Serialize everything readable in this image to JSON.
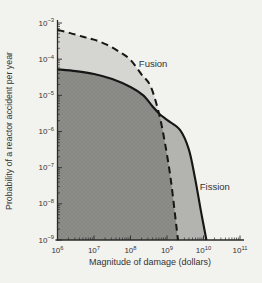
{
  "figure": {
    "background": "#f2f2ef",
    "text_color": "#333333",
    "curve_color": "#161616"
  },
  "chart_data": {
    "type": "area",
    "scale": "log-log",
    "title": "",
    "x_axis": {
      "label": "Magnitude of damage (dollars)",
      "scale": "log",
      "range_log10": [
        6,
        11
      ],
      "tick_exponents": [
        6,
        7,
        8,
        9,
        10,
        11
      ],
      "tick_labels": [
        "10^6",
        "10^7",
        "10^8",
        "10^9",
        "10^10",
        "10^11"
      ]
    },
    "y_axis": {
      "label": "Probability of a reactor accident per year",
      "scale": "log",
      "range_log10": [
        -9,
        -3
      ],
      "tick_exponents": [
        -3,
        -4,
        -5,
        -6,
        -7,
        -8,
        -9
      ],
      "tick_labels": [
        "10^-3",
        "10^-4",
        "10^-5",
        "10^-6",
        "10^-7",
        "10^-8",
        "10^-9"
      ]
    },
    "crossing_log10": [
      8.78,
      -5.5
    ],
    "overlap_fill": "#8d8d8a",
    "series": [
      {
        "name": "Fusion",
        "line_style": "dashed",
        "fill": "#d5d5d2",
        "label_pos_log10": [
          8.62,
          -4.13
        ],
        "points_log10": [
          [
            6.0,
            -3.19
          ],
          [
            6.35,
            -3.28
          ],
          [
            6.7,
            -3.38
          ],
          [
            7.0,
            -3.46
          ],
          [
            7.35,
            -3.6
          ],
          [
            7.7,
            -3.8
          ],
          [
            8.0,
            -4.02
          ],
          [
            8.3,
            -4.42
          ],
          [
            8.55,
            -4.75
          ],
          [
            8.78,
            -5.5
          ],
          [
            8.95,
            -6.35
          ],
          [
            9.1,
            -7.3
          ],
          [
            9.22,
            -8.3
          ],
          [
            9.3,
            -9.0
          ]
        ]
      },
      {
        "name": "Fission",
        "line_style": "solid",
        "fill": "#b3b3b0",
        "label_pos_log10": [
          10.31,
          -7.53
        ],
        "points_log10": [
          [
            6.0,
            -4.28
          ],
          [
            6.5,
            -4.33
          ],
          [
            7.0,
            -4.41
          ],
          [
            7.5,
            -4.55
          ],
          [
            8.0,
            -4.77
          ],
          [
            8.35,
            -5.0
          ],
          [
            8.6,
            -5.3
          ],
          [
            8.78,
            -5.5
          ],
          [
            9.0,
            -5.68
          ],
          [
            9.36,
            -5.96
          ],
          [
            9.6,
            -6.5
          ],
          [
            9.77,
            -7.3
          ],
          [
            9.93,
            -8.2
          ],
          [
            10.08,
            -9.0
          ]
        ]
      }
    ]
  }
}
